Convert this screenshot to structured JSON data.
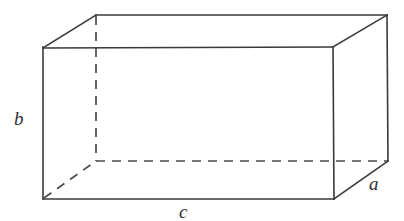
{
  "figure": {
    "type": "geometric-diagram",
    "background_color": "#ffffff",
    "line_color": "#3a3a3e",
    "hidden_line_color": "#4a4a50",
    "label_color": "#2f2f34"
  },
  "labels": {
    "height": "b",
    "length": "c",
    "depth": "a"
  },
  "geometry": {
    "front_face": {
      "top_left": [
        43,
        48
      ],
      "top_right": [
        333,
        48
      ],
      "bottom_right": [
        334,
        199
      ],
      "bottom_left": [
        43,
        199
      ]
    },
    "back_face": {
      "top_left": [
        96,
        15
      ],
      "top_right": [
        387,
        15
      ],
      "bottom_right": [
        388,
        161
      ],
      "bottom_left": [
        96,
        161
      ]
    },
    "hidden_edges": [
      "back-left-vertical",
      "back-bottom-horizontal",
      "bottom-left-diagonal"
    ],
    "visible_edges": [
      "front-top",
      "front-bottom",
      "front-left-vertical",
      "front-right-vertical",
      "back-top",
      "back-right-vertical",
      "top-left-diagonal",
      "top-right-diagonal",
      "bottom-right-diagonal"
    ]
  }
}
